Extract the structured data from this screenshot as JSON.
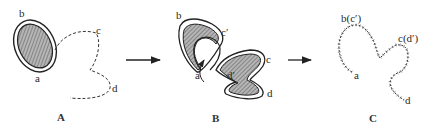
{
  "figure": {
    "panels": [
      {
        "id": "A",
        "caption": "A",
        "labels": {
          "b": "b",
          "a": "a",
          "c": "c",
          "d": "d"
        }
      },
      {
        "id": "B",
        "caption": "B",
        "labels": {
          "b": "b",
          "c_prime": "c′",
          "a": "a",
          "d_prime": "d′",
          "c": "c",
          "d": "d"
        }
      },
      {
        "id": "C",
        "caption": "C",
        "labels": {
          "b_c_prime": "b(c′)",
          "c_d_prime": "c(d′)",
          "a": "a",
          "d": "d"
        }
      }
    ],
    "arrows": [
      "A-to-B",
      "B-to-C"
    ],
    "colors": {
      "ink": "#2a2a2a",
      "hatch_fill": "#9a9a9a",
      "background": "#ffffff"
    }
  }
}
